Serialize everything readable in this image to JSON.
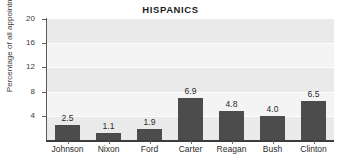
{
  "chart_data": {
    "type": "bar",
    "title": "HISPANICS",
    "xlabel": "",
    "ylabel": "Percentage of all appointments",
    "categories": [
      "Johnson",
      "Nixon",
      "Ford",
      "Carter",
      "Reagan",
      "Bush",
      "Clinton"
    ],
    "values": [
      2.5,
      1.1,
      1.9,
      6.9,
      4.8,
      4.0,
      6.5
    ],
    "value_labels": [
      "2.5",
      "1.1",
      "1.9",
      "6.9",
      "4.8",
      "4.0",
      "6.5"
    ],
    "ylim": [
      0,
      20
    ],
    "yticks": [
      4,
      8,
      12,
      16,
      20
    ],
    "ytick_labels": [
      "4",
      "8",
      "12",
      "16",
      "20"
    ],
    "grid": "horizontal-banded",
    "legend": "none",
    "colors": {
      "bar": "#4c4c4c",
      "plot_band_light": "#f4f4f4",
      "plot_band_dark": "#eaeaea",
      "gridline": "#ffffff",
      "axis": "#3d3d3d",
      "text": "#2b2b2b"
    }
  }
}
